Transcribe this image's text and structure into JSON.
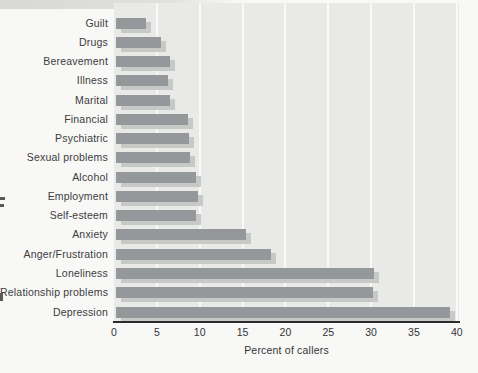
{
  "chart_data": {
    "type": "bar",
    "orientation": "horizontal",
    "title": "",
    "xlabel": "Percent of callers",
    "ylabel": "",
    "xlim": [
      0,
      40
    ],
    "xticks": [
      0,
      5,
      10,
      15,
      20,
      25,
      30,
      35,
      40
    ],
    "grid": "vertical-white-lines",
    "legend": "none",
    "categories": [
      "Guilt",
      "Drugs",
      "Bereavement",
      "Illness",
      "Marital",
      "Financial",
      "Psychiatric",
      "Sexual problems",
      "Alcohol",
      "Employment",
      "Self-esteem",
      "Anxiety",
      "Anger/Frustration",
      "Loneliness",
      "Relationship problems",
      "Depression"
    ],
    "values": [
      3.5,
      5.3,
      6.3,
      6.1,
      6.3,
      8.4,
      8.5,
      8.6,
      9.3,
      9.6,
      9.3,
      15.2,
      18.1,
      30.1,
      30.0,
      39.0
    ],
    "colors": {
      "bar": "#95989a",
      "bar_shadow": "#c7c9c7",
      "plot_background": "#e9e9e7",
      "gridline": "#fbfbf9",
      "axis_line": "#2c2c2c",
      "label_text": "#3c3c3e"
    }
  }
}
